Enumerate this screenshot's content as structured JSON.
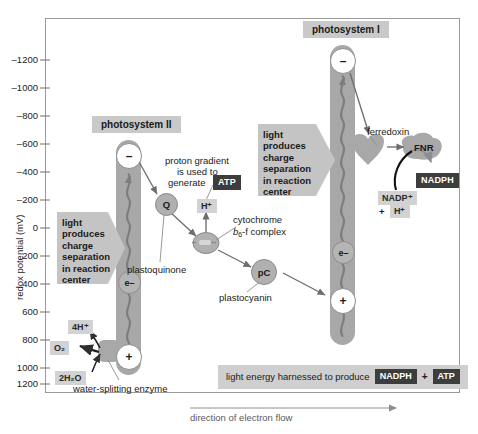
{
  "figure": {
    "type": "diagram",
    "y_axis_label": "redox potential (mV)",
    "y_ticks": [
      "–1200",
      "–1000",
      "–800",
      "–600",
      "–400",
      "–200",
      "0",
      "200",
      "400",
      "600",
      "800",
      "1000",
      "1200"
    ],
    "flow_label": "direction of electron flow"
  },
  "photosystem2": {
    "title": "photosystem II",
    "top_sign": "–",
    "bottom_sign": "+",
    "electron_label": "e–",
    "callout": "light\nproduces\ncharge\nseparation\nin reaction\ncenter"
  },
  "photosystem1": {
    "title": "photosystem I",
    "top_sign": "–",
    "bottom_sign": "+",
    "electron_label": "e–",
    "callout": "light\nproduces\ncharge\nseparation\nin reaction\ncenter"
  },
  "carriers": {
    "q_symbol": "Q",
    "plastoquinone_label": "plastoquinone",
    "pc_symbol": "pC",
    "plastocyanin_label": "plastocyanin",
    "cytochrome_line1": "cytochrome",
    "cytochrome_line2_italic": "b",
    "cytochrome_line2_sub": "6",
    "cytochrome_line2_rest": "-f complex",
    "ferredoxin_label": "ferredoxin",
    "fnr_label": "FNR"
  },
  "proton_gradient": {
    "text_line1": "proton gradient",
    "text_line2": "is used to",
    "text_line3": "generate",
    "atp_badge": "ATP",
    "proton_tag": "H⁺"
  },
  "water_splitting": {
    "enzyme_label": "water-splitting enzyme",
    "protons_tag": "4H⁺",
    "oxygen_tag": "O₂",
    "water_tag": "2H₂O"
  },
  "nadph_side": {
    "nadp_tag": "NADP⁺",
    "plus_sign": "+",
    "proton_tag": "H⁺",
    "nadph_badge": "NADPH"
  },
  "summary_banner": {
    "text": "light energy harnessed to produce",
    "nadph_badge": "NADPH",
    "plus": "+",
    "atp_badge": "ATP"
  },
  "colors": {
    "bar_grey": "#a8a8a8",
    "chip_grey": "#c9c9c9",
    "tag_grey": "#d2d2d2",
    "badge_dark": "#3d3d3d",
    "frame": "#9a9a9a",
    "arrow": "#6e6e6e"
  }
}
